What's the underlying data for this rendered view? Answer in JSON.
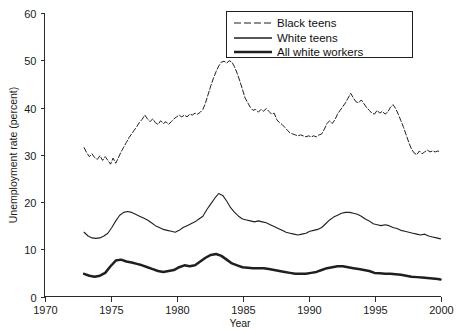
{
  "chart_data": {
    "type": "line",
    "title": "",
    "xlabel": "Year",
    "ylabel": "Unemployment rate (percent)",
    "xlim": [
      1970,
      2000
    ],
    "ylim": [
      0,
      60
    ],
    "xticks": [
      1970,
      1975,
      1980,
      1985,
      1990,
      1995,
      2000
    ],
    "yticks": [
      0,
      10,
      20,
      30,
      40,
      50,
      60
    ],
    "grid": false,
    "legend_position": "top-right",
    "series": [
      {
        "name": "Black teens",
        "style": "dashed",
        "x": [
          1973.0,
          1973.2,
          1973.4,
          1973.6,
          1973.8,
          1974.0,
          1974.2,
          1974.4,
          1974.6,
          1974.8,
          1975.0,
          1975.2,
          1975.4,
          1975.6,
          1975.8,
          1976.0,
          1976.2,
          1976.4,
          1976.6,
          1976.8,
          1977.0,
          1977.2,
          1977.4,
          1977.6,
          1977.8,
          1978.0,
          1978.2,
          1978.4,
          1978.6,
          1978.8,
          1979.0,
          1979.2,
          1979.4,
          1979.6,
          1979.8,
          1980.0,
          1980.2,
          1980.4,
          1980.6,
          1980.8,
          1981.0,
          1981.2,
          1981.4,
          1981.6,
          1981.8,
          1982.0,
          1982.2,
          1982.4,
          1982.6,
          1982.8,
          1983.0,
          1983.2,
          1983.4,
          1983.6,
          1983.8,
          1984.0,
          1984.2,
          1984.4,
          1984.6,
          1984.8,
          1985.0,
          1985.2,
          1985.4,
          1985.6,
          1985.8,
          1986.0,
          1986.2,
          1986.4,
          1986.6,
          1986.8,
          1987.0,
          1987.2,
          1987.4,
          1987.6,
          1987.8,
          1988.0,
          1988.2,
          1988.4,
          1988.6,
          1988.8,
          1989.0,
          1989.2,
          1989.4,
          1989.6,
          1989.8,
          1990.0,
          1990.2,
          1990.4,
          1990.6,
          1990.8,
          1991.0,
          1991.2,
          1991.4,
          1991.6,
          1991.8,
          1992.0,
          1992.2,
          1992.4,
          1992.6,
          1992.8,
          1993.0,
          1993.2,
          1993.4,
          1993.6,
          1993.8,
          1994.0,
          1994.2,
          1994.4,
          1994.6,
          1994.8,
          1995.0,
          1995.2,
          1995.4,
          1995.6,
          1995.8,
          1996.0,
          1996.2,
          1996.4,
          1996.6,
          1996.8,
          1997.0,
          1997.2,
          1997.4,
          1997.6,
          1997.8,
          1998.0,
          1998.2,
          1998.4,
          1998.6,
          1998.8,
          1999.0,
          1999.2,
          1999.4,
          1999.6,
          1999.8,
          2000.0
        ],
        "values": [
          31.5,
          30.4,
          29.6,
          30.2,
          29.4,
          29.0,
          29.8,
          28.8,
          29.6,
          28.8,
          28.0,
          29.3,
          28.2,
          29.4,
          30.6,
          31.6,
          32.6,
          33.6,
          34.4,
          35.2,
          36.0,
          36.9,
          37.5,
          38.4,
          37.6,
          37.0,
          37.6,
          36.8,
          36.4,
          37.2,
          36.6,
          37.0,
          36.4,
          37.0,
          37.6,
          38.0,
          38.4,
          38.0,
          38.4,
          38.0,
          38.6,
          38.4,
          38.8,
          38.6,
          39.0,
          39.6,
          41.0,
          42.8,
          44.6,
          46.2,
          47.6,
          48.8,
          49.6,
          49.8,
          49.4,
          49.9,
          49.6,
          48.6,
          47.2,
          45.6,
          43.8,
          42.0,
          41.0,
          40.0,
          39.4,
          39.6,
          39.0,
          39.6,
          39.2,
          39.8,
          39.2,
          38.6,
          38.8,
          37.4,
          36.8,
          36.4,
          35.8,
          35.2,
          34.6,
          34.4,
          34.2,
          34.0,
          34.2,
          34.0,
          33.8,
          34.0,
          33.8,
          34.0,
          33.8,
          34.2,
          34.4,
          35.4,
          36.6,
          37.2,
          36.6,
          37.4,
          38.6,
          39.4,
          40.2,
          41.0,
          42.0,
          43.0,
          42.0,
          41.2,
          41.0,
          41.6,
          40.8,
          40.0,
          39.4,
          38.8,
          38.6,
          39.4,
          38.8,
          39.2,
          38.6,
          39.0,
          40.0,
          40.6,
          39.8,
          38.6,
          37.2,
          35.8,
          34.2,
          32.6,
          31.2,
          30.4,
          30.0,
          30.8,
          30.2,
          30.6,
          31.0,
          30.6,
          30.8,
          30.6,
          30.8,
          30.6
        ]
      },
      {
        "name": "White teens",
        "style": "solid-thin",
        "x": [
          1973.0,
          1973.3,
          1973.6,
          1973.9,
          1974.2,
          1974.5,
          1974.8,
          1975.1,
          1975.4,
          1975.7,
          1976.0,
          1976.3,
          1976.6,
          1976.9,
          1977.2,
          1977.5,
          1977.8,
          1978.1,
          1978.4,
          1978.7,
          1979.0,
          1979.3,
          1979.6,
          1979.9,
          1980.2,
          1980.5,
          1980.8,
          1981.1,
          1981.4,
          1981.7,
          1982.0,
          1982.3,
          1982.6,
          1982.9,
          1983.2,
          1983.5,
          1983.8,
          1984.1,
          1984.4,
          1984.7,
          1985.0,
          1985.3,
          1985.6,
          1985.9,
          1986.2,
          1986.5,
          1986.8,
          1987.1,
          1987.4,
          1987.7,
          1988.0,
          1988.3,
          1988.6,
          1988.9,
          1989.2,
          1989.5,
          1989.8,
          1990.1,
          1990.4,
          1990.7,
          1991.0,
          1991.3,
          1991.6,
          1991.9,
          1992.2,
          1992.5,
          1992.8,
          1993.1,
          1993.4,
          1993.7,
          1994.0,
          1994.3,
          1994.6,
          1994.9,
          1995.2,
          1995.5,
          1995.8,
          1996.1,
          1996.4,
          1996.7,
          1997.0,
          1997.3,
          1997.6,
          1997.9,
          1998.2,
          1998.5,
          1998.8,
          1999.1,
          1999.4,
          1999.7,
          2000.0
        ],
        "values": [
          13.6,
          12.8,
          12.4,
          12.3,
          12.4,
          12.8,
          13.4,
          14.6,
          16.0,
          17.2,
          17.8,
          18.0,
          17.8,
          17.4,
          17.0,
          16.6,
          16.2,
          15.6,
          15.0,
          14.6,
          14.2,
          14.0,
          13.8,
          13.6,
          14.0,
          14.6,
          15.0,
          15.4,
          15.8,
          16.4,
          17.0,
          18.4,
          19.6,
          20.8,
          21.8,
          21.4,
          20.2,
          18.8,
          17.8,
          17.0,
          16.4,
          16.2,
          16.0,
          15.8,
          16.0,
          15.8,
          15.6,
          15.2,
          14.8,
          14.4,
          14.0,
          13.6,
          13.4,
          13.2,
          13.0,
          13.2,
          13.4,
          13.8,
          14.0,
          14.2,
          14.6,
          15.4,
          16.2,
          16.8,
          17.2,
          17.6,
          17.8,
          17.8,
          17.6,
          17.4,
          17.0,
          16.4,
          16.0,
          15.4,
          15.2,
          15.0,
          15.2,
          15.0,
          14.6,
          14.4,
          14.0,
          13.8,
          13.6,
          13.4,
          13.2,
          13.0,
          13.2,
          12.8,
          12.6,
          12.4,
          12.2
        ]
      },
      {
        "name": "All white workers",
        "style": "solid-thick",
        "x": [
          1973.0,
          1973.4,
          1973.8,
          1974.2,
          1974.6,
          1975.0,
          1975.4,
          1975.8,
          1976.2,
          1976.6,
          1977.0,
          1977.4,
          1977.8,
          1978.2,
          1978.6,
          1979.0,
          1979.4,
          1979.8,
          1980.2,
          1980.6,
          1981.0,
          1981.4,
          1981.8,
          1982.2,
          1982.6,
          1983.0,
          1983.4,
          1983.8,
          1984.2,
          1984.6,
          1985.0,
          1985.4,
          1985.8,
          1986.2,
          1986.6,
          1987.0,
          1987.4,
          1987.8,
          1988.2,
          1988.6,
          1989.0,
          1989.4,
          1989.8,
          1990.2,
          1990.6,
          1991.0,
          1991.4,
          1991.8,
          1992.2,
          1992.6,
          1993.0,
          1993.4,
          1993.8,
          1994.2,
          1994.6,
          1995.0,
          1995.4,
          1995.8,
          1996.2,
          1996.6,
          1997.0,
          1997.4,
          1997.8,
          1998.2,
          1998.6,
          1999.0,
          1999.4,
          1999.8,
          2000.0
        ],
        "values": [
          4.8,
          4.4,
          4.2,
          4.4,
          5.0,
          6.4,
          7.6,
          7.8,
          7.4,
          7.2,
          6.9,
          6.6,
          6.2,
          5.8,
          5.4,
          5.2,
          5.4,
          5.6,
          6.2,
          6.6,
          6.4,
          6.6,
          7.4,
          8.2,
          8.8,
          9.0,
          8.6,
          7.8,
          7.0,
          6.6,
          6.2,
          6.1,
          6.0,
          6.0,
          6.0,
          5.8,
          5.6,
          5.4,
          5.2,
          5.0,
          4.8,
          4.8,
          4.8,
          5.0,
          5.2,
          5.6,
          6.0,
          6.2,
          6.4,
          6.4,
          6.2,
          6.0,
          5.8,
          5.6,
          5.4,
          5.0,
          4.9,
          4.8,
          4.8,
          4.7,
          4.6,
          4.4,
          4.2,
          4.1,
          4.0,
          3.9,
          3.8,
          3.7,
          3.6
        ]
      }
    ]
  },
  "legend": {
    "items": [
      {
        "label": "Black teens",
        "style": "dashed"
      },
      {
        "label": "White teens",
        "style": "solid-thin"
      },
      {
        "label": "All white workers",
        "style": "solid-thick"
      }
    ]
  },
  "axes": {
    "y_title": "Unemployment rate (percent)",
    "x_title": "Year",
    "x_tick_labels": [
      "1970",
      "1975",
      "1980",
      "1985",
      "1990",
      "1995",
      "2000"
    ],
    "y_tick_labels": [
      "0",
      "10",
      "20",
      "30",
      "40",
      "50",
      "60"
    ]
  },
  "colors": {
    "line": "#1f1f1f",
    "axis": "#2b2b2b",
    "background": "#ffffff"
  }
}
